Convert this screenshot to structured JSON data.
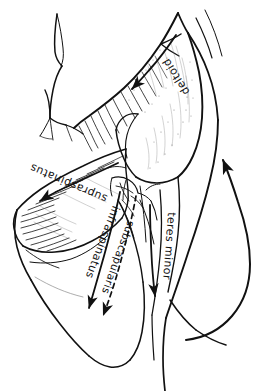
{
  "figure": {
    "style": "hand-drawn pen-and-ink anatomical sketch",
    "background_color": "#ffffff",
    "ink_color": "#111111",
    "width": 277,
    "height": 391
  },
  "labels": {
    "deltoid": "deltoid",
    "supraspinatus": "supraspinatus",
    "infraspinatus": "infraspinatus",
    "subscapularis": "subscapularis",
    "teres_minor": "teres minor"
  },
  "annotations": [
    {
      "name": "deltoid",
      "text": "deltoid",
      "arrow": "solid",
      "direction": "down-left",
      "rotation_deg": 240
    },
    {
      "name": "supraspinatus",
      "text": "supraspinatus",
      "arrow": "solid",
      "direction": "down-left",
      "rotation_deg": 200
    },
    {
      "name": "infraspinatus",
      "text": "infraspinatus",
      "arrow": "solid",
      "direction": "down",
      "rotation_deg": 250
    },
    {
      "name": "subscapularis",
      "text": "subscapularis",
      "arrow": "dashed",
      "direction": "down-left",
      "rotation_deg": 255
    },
    {
      "name": "teres-minor",
      "text": "teres minor",
      "arrow": "solid",
      "direction": "down",
      "rotation_deg": 265
    },
    {
      "name": "rotation-arrow",
      "text": "",
      "arrow": "solid",
      "direction": "up",
      "rotation_deg": 0
    }
  ]
}
